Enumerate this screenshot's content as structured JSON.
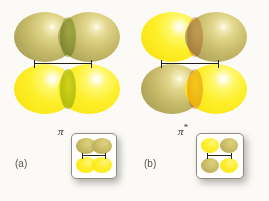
{
  "figure": {
    "background_color": "#fbfaf6",
    "panels": [
      {
        "id": "a",
        "caption": "(a)",
        "orbital_symbol": "π",
        "orbital_symbol_star": "",
        "description": "pi bonding molecular orbital",
        "top_row": {
          "left_lobe_color": "#c8bc6a",
          "right_lobe_color": "#c8bc6a",
          "overlap_color": "#b6d185"
        },
        "bottom_row": {
          "left_lobe_color": "#fdef2a",
          "right_lobe_color": "#fdef2a",
          "overlap_color": "#b6d185"
        },
        "inset": {
          "description": "end-on view, lobes merged",
          "top_lobe_color": "#cdc068",
          "bottom_lobe_color": "#ffef2e"
        }
      },
      {
        "id": "b",
        "caption": "(b)",
        "orbital_symbol": "π",
        "orbital_symbol_star": "*",
        "description": "pi antibonding molecular orbital",
        "top_row": {
          "left_lobe_color": "#fdef2a",
          "right_lobe_color": "#c8bc6a",
          "overlap_color": "#efbda6"
        },
        "bottom_row": {
          "left_lobe_color": "#c8bc6a",
          "right_lobe_color": "#fdef2a",
          "overlap_color": "#efbda6"
        },
        "inset": {
          "description": "end-on view, four separate lobes",
          "top_left_lobe_color": "#ffef2e",
          "top_right_lobe_color": "#cdc068",
          "bottom_left_lobe_color": "#cdc068",
          "bottom_right_lobe_color": "#ffef2e"
        }
      }
    ],
    "bond_axis_color": "#241f14"
  }
}
